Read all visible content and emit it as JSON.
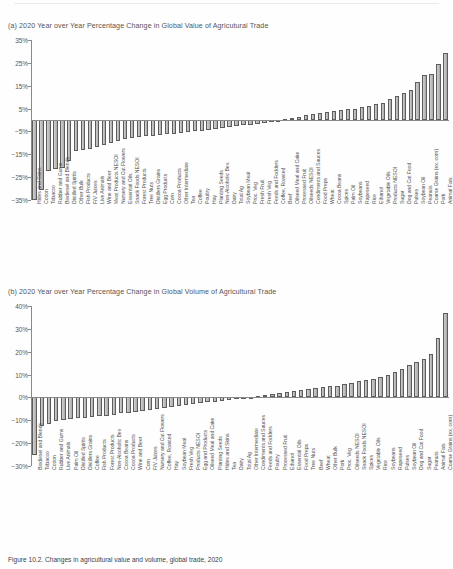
{
  "figure": {
    "caption": "Figure 10.2. Changes in agricultural value and volume, global trade, 2020",
    "panel_a_title": "(a)  2020 Year over Year Percentage Change in Global Value of Agricutural Trade",
    "panel_b_title": "(b)  2020 Year over Year Percentage Change in Global Volume of Agricultural Trade"
  },
  "chart_data": [
    {
      "type": "bar",
      "title": "(a)  2020 Year over Year Percentage Change in Global Value of Agricutural Trade",
      "xlabel": "",
      "ylabel": "",
      "ylim": [
        -35,
        35
      ],
      "yticks": [
        35,
        25,
        15,
        5,
        -5,
        -15,
        -25,
        -35
      ],
      "ytick_labels": [
        "35%",
        "25%",
        "15%",
        "5%",
        "-5%",
        "-15%",
        "-25%",
        "-35%"
      ],
      "grid": false,
      "legend": "none",
      "categories": [
        "Hides and Skins",
        "Cotton",
        "Tobacco",
        "Rubber and Gums",
        "Biodiesel and Blends",
        "Distilled Spirits",
        "Other Bulk",
        "Fish Products",
        "F/V Juices",
        "Live Animals",
        "Wine and Beer",
        "Meat Products NESOI",
        "Nursery and Cut Flowers",
        "Essential Oils",
        "Snack Foods NESOI",
        "Forest Products",
        "Tree Nuts",
        "Distillers Grains",
        "Egg Products",
        "Corn",
        "Cocoa Products",
        "Other Intermediate",
        "Tea",
        "Coffee",
        "Poultry",
        "Hay",
        "Planting Seeds",
        "Non-Alcoholic Bev.",
        "Dairy",
        "Total Ag",
        "Soybean Meal",
        "Proc. Veg",
        "Fresh Fruit",
        "Fresh Veg",
        "Feeds and Fodders",
        "Coffee, Roasted",
        "Beef",
        "Oilseed Meal and Cake",
        "Processed Fruit",
        "Oilseeds NESOI",
        "Condiments and Sauces",
        "Food Preps",
        "Wheat",
        "Cocoa Beans",
        "Spices",
        "Palm Oil",
        "Soybeans",
        "Rapeseed",
        "Rice",
        "Ethanol",
        "Vegetable Oils",
        "Products NESOI",
        "Sugar",
        "Dog and Cat Food",
        "Pulses",
        "Soybean Oil",
        "Peanuts",
        "Coarse Grains (ex. corn)",
        "Pork",
        "Animal Fats"
      ],
      "values": [
        -35.0,
        -30.5,
        -22.5,
        -21.5,
        -21.0,
        -18.0,
        -13.5,
        -13.0,
        -12.5,
        -12.0,
        -11.0,
        -10.0,
        -9.0,
        -8.5,
        -8.0,
        -7.5,
        -7.0,
        -6.8,
        -6.5,
        -6.2,
        -6.0,
        -5.5,
        -5.2,
        -5.0,
        -4.6,
        -4.2,
        -4.0,
        -3.6,
        -3.2,
        -2.8,
        -2.4,
        -2.0,
        -1.6,
        -1.2,
        -0.8,
        -0.4,
        0.4,
        0.8,
        1.4,
        2.2,
        2.8,
        3.2,
        3.6,
        3.8,
        4.2,
        4.6,
        5.0,
        5.6,
        6.2,
        6.8,
        7.6,
        9.0,
        10.5,
        12.0,
        13.0,
        16.5,
        19.5,
        20.0,
        24.5,
        29.5
      ]
    },
    {
      "type": "bar",
      "title": "(b)  2020 Year over Year Percentage Change in Global Volume of Agricultural Trade",
      "xlabel": "",
      "ylabel": "",
      "ylim": [
        -30,
        40
      ],
      "yticks": [
        40,
        30,
        20,
        10,
        0,
        -10,
        -20,
        -30
      ],
      "ytick_labels": [
        "40%",
        "30%",
        "20%",
        "10%",
        "0%",
        "-10%",
        "-20%",
        "-30%"
      ],
      "grid": false,
      "legend": "none",
      "categories": [
        "Biodiesel and Blends",
        "Tobacco",
        "Cotton",
        "Rubber and Gums",
        "Live Animals",
        "Palm Oil",
        "Distilled Spirits",
        "Distillers Grains",
        "Coffee",
        "Fish Products",
        "Forest Products",
        "Non-Alcoholic Bev",
        "Cocoa Beans",
        "Cocoa Products",
        "Wine and Beer",
        "Corn",
        "F/V Juices",
        "Nursery and Cut Flowers",
        "Coffee, Roasted",
        "Hay",
        "Soybean Meal",
        "Fresh Veg",
        "Products NESOI",
        "Egg and Products",
        "Oilseed Meal and Cake",
        "Planting Seeds",
        "Hides and Skins",
        "Tea",
        "Dairy",
        "Total Ag",
        "Other Intermediate",
        "Condiments and Sauces",
        "Feeds and Fodders",
        "Poultry",
        "Processed Fruit",
        "Ethanol",
        "Essential Oils",
        "Food Preps",
        "Tree Nuts",
        "Beef",
        "Wheat",
        "Other Bulk",
        "Pork",
        "Proc. Veg",
        "Oilseeds NESOI",
        "Snack Foods NESOI",
        "Spices",
        "Vegetable Oils",
        "Rice",
        "Soybeans",
        "Rapeseed",
        "Pulses",
        "Soybean Oil",
        "Dog and Cat Food",
        "Sugar",
        "Peanuts",
        "Animal Fats",
        "Coarse Grains (ex. corn)"
      ],
      "values": [
        -25.0,
        -12.5,
        -11.5,
        -10.5,
        -10.0,
        -9.5,
        -9.2,
        -9.0,
        -8.5,
        -8.2,
        -8.0,
        -7.5,
        -7.0,
        -6.6,
        -6.2,
        -5.8,
        -5.4,
        -5.0,
        -4.6,
        -4.2,
        -3.8,
        -3.4,
        -3.0,
        -2.6,
        -2.2,
        -1.8,
        -1.4,
        -1.0,
        -0.6,
        -0.2,
        0.4,
        0.8,
        1.2,
        1.6,
        2.0,
        2.4,
        2.8,
        3.2,
        3.6,
        4.0,
        4.4,
        4.8,
        5.2,
        5.8,
        6.4,
        7.0,
        7.6,
        8.2,
        9.0,
        10.0,
        11.0,
        12.5,
        14.0,
        15.5,
        17.0,
        19.0,
        26.0,
        37.0
      ]
    }
  ]
}
